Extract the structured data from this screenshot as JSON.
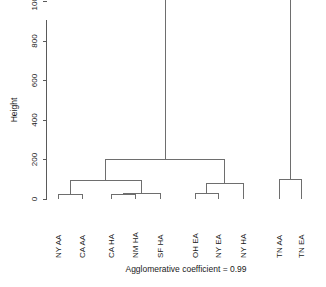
{
  "chart_data": {
    "type": "dendrogram",
    "title": "",
    "subtitle": "",
    "xlabel": "",
    "ylabel": "Height",
    "caption": "Agglomerative coefficient = 0.99",
    "agglomerative_coefficient": 0.99,
    "grid": false,
    "legend": "none",
    "ylim": [
      0,
      1150
    ],
    "yticks": [
      0,
      200,
      400,
      600,
      800,
      1000
    ],
    "ytick_labels": [
      "0",
      "200",
      "400",
      "600",
      "800",
      "1000"
    ],
    "leaves": [
      {
        "label": "NY AA",
        "order": 1
      },
      {
        "label": "CA AA",
        "order": 2
      },
      {
        "label": "CA HA",
        "order": 3
      },
      {
        "label": "NM HA",
        "order": 4
      },
      {
        "label": "SF HA",
        "order": 5
      },
      {
        "label": "OH EA",
        "order": 6
      },
      {
        "label": "NY EA",
        "order": 7
      },
      {
        "label": "NY HA",
        "order": 8
      },
      {
        "label": "TN AA",
        "order": 9
      },
      {
        "label": "TN EA",
        "order": 10
      }
    ],
    "merges": [
      {
        "id": "m1",
        "left": "NY AA",
        "right": "CA AA",
        "height": 25
      },
      {
        "id": "m2",
        "left": "CA HA",
        "right": "NM HA",
        "height": 25
      },
      {
        "id": "m3",
        "left": "m2",
        "right": "SF HA",
        "height": 30
      },
      {
        "id": "m4",
        "left": "m1",
        "right": "m3",
        "height": 95
      },
      {
        "id": "m5",
        "left": "OH EA",
        "right": "NY EA",
        "height": 30
      },
      {
        "id": "m6",
        "left": "m5",
        "right": "NY HA",
        "height": 80
      },
      {
        "id": "m7",
        "left": "m4",
        "right": "m6",
        "height": 200
      },
      {
        "id": "m8",
        "left": "TN AA",
        "right": "TN EA",
        "height": 100
      },
      {
        "id": "m9",
        "left": "m7",
        "right": "m8",
        "height": 1120
      }
    ]
  },
  "axes": {
    "y_title": "Height"
  },
  "caption": {
    "text": "Agglomerative coefficient = 0.99"
  },
  "colors": {
    "background": "#ffffff",
    "line": "#6e6e6e",
    "axis": "#5a5a5a",
    "text": "#1a1a1a"
  }
}
